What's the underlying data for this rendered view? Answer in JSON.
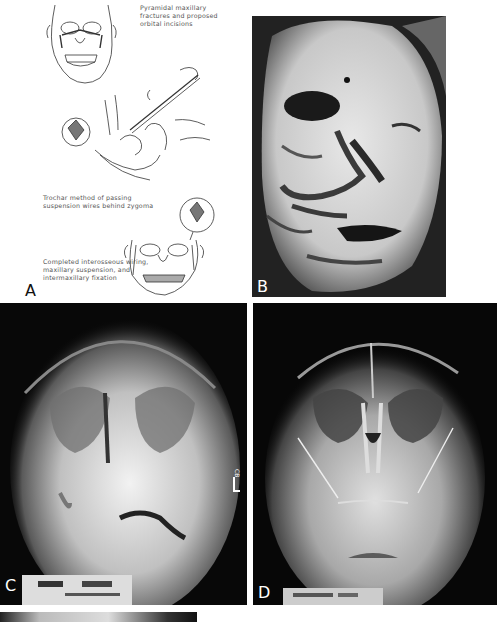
{
  "figure": {
    "panels": [
      {
        "id": "A",
        "label": "A",
        "type": "illustration",
        "captions": {
          "top": "Pyramidal maxillary\nfractures and proposed\norbital incisions",
          "middle": "Trochar method of passing\nsuspension wires behind zygoma",
          "bottom": "Completed interosseous wiring,\nmaxillary suspension, and\nintermaxillary fixation"
        }
      },
      {
        "id": "B",
        "label": "B",
        "type": "clinical-photograph"
      },
      {
        "id": "C",
        "label": "C",
        "type": "radiograph",
        "side_marker": "L CB"
      },
      {
        "id": "D",
        "label": "D",
        "type": "radiograph"
      },
      {
        "id": "E",
        "label": "",
        "type": "radiograph-partial"
      }
    ]
  },
  "colors": {
    "background": "#ffffff",
    "xray_background": "#080808",
    "line_art": "#333333"
  }
}
